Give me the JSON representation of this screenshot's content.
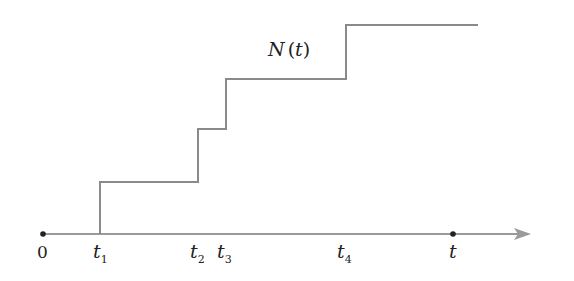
{
  "diagram": {
    "curve_label": {
      "func": "N",
      "open": "(",
      "arg": "t",
      "close": ")"
    },
    "axis": {
      "origin_label": "0",
      "end_label": "t"
    },
    "event_times": [
      {
        "name": "t",
        "sub": "1",
        "value": 1
      },
      {
        "name": "t",
        "sub": "2",
        "value": 2
      },
      {
        "name": "t",
        "sub": "3",
        "value": 3
      },
      {
        "name": "t",
        "sub": "4",
        "value": 4
      }
    ],
    "colors": {
      "curve": "#8a8a8a",
      "axis": "#9a9a9a",
      "dot": "#222222",
      "text": "#222222"
    }
  }
}
